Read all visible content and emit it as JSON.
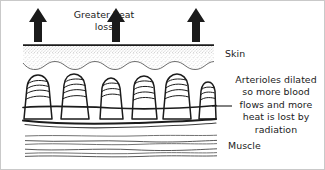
{
  "figure": {
    "width": 325,
    "height": 170,
    "background_color": "#ffffff",
    "border_color": "#c9c9c9",
    "ink_color": "#1b1b1b"
  },
  "labels": {
    "greater_heat_loss": "Greater heat loss",
    "skin": "Skin",
    "muscle": "Muscle",
    "arterioles_note": "Arterioles dilated so more blood flows and more heat is lost by radiation"
  },
  "arrows": {
    "name": "heat-loss-arrow",
    "direction": "up",
    "count": 3,
    "color": "#1b1b1b",
    "positions_x": [
      37,
      115,
      195
    ],
    "tip_y": 8,
    "tail_y": 41
  },
  "layers": [
    {
      "name": "epidermis-stipple",
      "label": "Skin",
      "fill": "stipple",
      "top_y": 43,
      "bottom_y": 68
    },
    {
      "name": "dermis-papillae",
      "label": "Arterioles",
      "top_y": 68,
      "bottom_y": 122
    },
    {
      "name": "muscle-fibres",
      "label": "Muscle",
      "top_y": 133,
      "bottom_y": 160,
      "line_count": 6
    }
  ],
  "papillae": {
    "name": "dilated-arteriole",
    "count": 6,
    "centers_x": [
      36,
      73,
      110,
      143,
      176,
      207
    ],
    "widths": [
      30,
      30,
      24,
      26,
      30,
      20
    ],
    "top_y": 74,
    "base_y": 119
  },
  "leader_line": {
    "name": "annotation-leader-line",
    "from_x": 211,
    "to_x": 231,
    "y": 105
  }
}
